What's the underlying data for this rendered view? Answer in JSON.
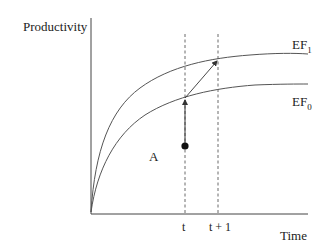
{
  "diagram": {
    "y_axis_label": "Productivity",
    "x_axis_label": "Time",
    "ticks": [
      {
        "label": "t"
      },
      {
        "label": "t + 1"
      }
    ],
    "curves": [
      {
        "name": "EF",
        "subscript": "1"
      },
      {
        "name": "EF",
        "subscript": "0"
      }
    ],
    "point_label": "A",
    "colors": {
      "line": "#555555",
      "text": "#222222",
      "dot": "#111111"
    }
  }
}
